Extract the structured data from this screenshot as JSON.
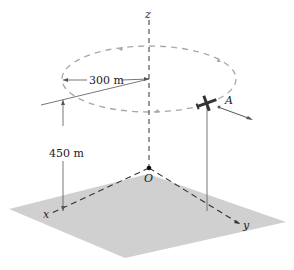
{
  "diagram": {
    "axes": {
      "x_label": "x",
      "y_label": "y",
      "z_label": "z",
      "origin_label": "O"
    },
    "dimensions": {
      "radius_label": "300 m",
      "height_label": "450 m"
    },
    "aircraft": {
      "point_label": "A"
    },
    "colors": {
      "ground_plane": "#cfcfcf",
      "circle_path": "#a8a8a8",
      "axis_lines": "#333333",
      "text": "#222222"
    }
  }
}
